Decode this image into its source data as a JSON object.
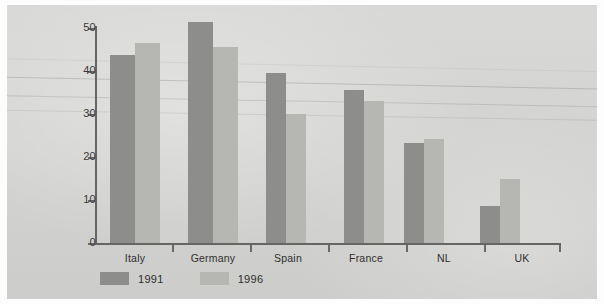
{
  "chart_data": {
    "type": "bar",
    "title": "",
    "subtitle": "",
    "xlabel": "",
    "ylabel": "",
    "categories": [
      "Italy",
      "Germany",
      "Spain",
      "France",
      "NL",
      "UK"
    ],
    "series": [
      {
        "name": "1991",
        "color": "#8d8d8b",
        "values": [
          43.8,
          51.3,
          39.5,
          35.5,
          23.3,
          8.5
        ]
      },
      {
        "name": "1996",
        "color": "#b6b6b3",
        "values": [
          46.5,
          45.7,
          30.0,
          33.0,
          24.1,
          15.0
        ]
      }
    ],
    "ylim": [
      0,
      50
    ],
    "yticks": [
      0,
      10,
      20,
      30,
      40,
      50
    ],
    "ytick_labels": [
      "0",
      "10",
      "20",
      "30",
      "40",
      "50"
    ],
    "grid": false,
    "legend_position": "bottom-left",
    "background_color": "#d4d4d2"
  },
  "legend": {
    "items": [
      {
        "label": "1991",
        "color": "#8d8d8b"
      },
      {
        "label": "1996",
        "color": "#b6b6b3"
      }
    ]
  },
  "axis": {
    "y_labels": [
      "50",
      "40",
      "30",
      "20",
      "10",
      "0"
    ],
    "x_labels": [
      "Italy",
      "Germany",
      "Spain",
      "France",
      "NL",
      "UK"
    ]
  }
}
